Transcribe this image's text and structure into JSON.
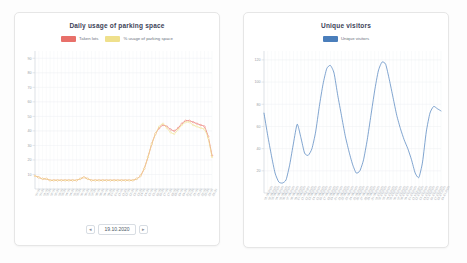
{
  "page": {
    "background": "#fdfdfd",
    "card_background": "#ffffff",
    "card_border": "#e6e6e6"
  },
  "cards": {
    "parking": {
      "title": "Daily usage of parking space",
      "pager": {
        "prev_label": "◂",
        "next_label": "▸",
        "date": "19.10.2020"
      }
    },
    "visitors": {
      "title": "Unique visitors"
    }
  },
  "chart_data": [
    {
      "type": "line",
      "name": "parking-usage-chart",
      "title": "Daily usage of parking space",
      "xlabel": "",
      "ylabel": "",
      "ylim": [
        0,
        95
      ],
      "yticks": [
        10,
        20,
        30,
        40,
        50,
        60,
        70,
        80,
        90
      ],
      "grid": true,
      "legend_position": "top-center",
      "categories": [
        "00:00",
        "00:30",
        "01:00",
        "01:30",
        "02:00",
        "02:30",
        "03:00",
        "03:30",
        "04:00",
        "04:30",
        "05:00",
        "05:30",
        "06:00",
        "06:30",
        "07:00",
        "07:30",
        "08:00",
        "08:30",
        "09:00",
        "09:30",
        "10:00",
        "10:30",
        "11:00",
        "11:30",
        "12:00",
        "12:30",
        "13:00",
        "13:30",
        "14:00",
        "14:30",
        "15:00",
        "15:30",
        "16:00",
        "16:30",
        "17:00",
        "17:30",
        "18:00",
        "18:30",
        "19:00",
        "19:30",
        "20:00",
        "20:30",
        "21:00",
        "21:30",
        "22:00",
        "22:30",
        "23:00",
        "23:30"
      ],
      "series": [
        {
          "name": "Taken lots",
          "color": "#e8706a",
          "values": [
            9,
            8,
            7,
            7,
            6,
            6,
            6,
            6,
            6,
            6,
            6,
            6,
            7,
            8,
            7,
            6,
            6,
            6,
            6,
            6,
            6,
            6,
            6,
            6,
            6,
            6,
            6,
            7,
            9,
            14,
            22,
            31,
            38,
            42,
            44,
            43,
            41,
            40,
            42,
            45,
            47,
            47,
            46,
            45,
            44,
            43,
            36,
            23
          ]
        },
        {
          "name": "% usage of parking space",
          "color": "#efe08c",
          "values": [
            9,
            8,
            7,
            7,
            6,
            6,
            6,
            6,
            6,
            6,
            6,
            6,
            7,
            8,
            7,
            6,
            6,
            6,
            6,
            6,
            6,
            6,
            6,
            6,
            6,
            6,
            6,
            7,
            9,
            14,
            22,
            31,
            38,
            43,
            45,
            42,
            39,
            38,
            41,
            44,
            46,
            46,
            44,
            43,
            42,
            41,
            35,
            22
          ]
        }
      ]
    },
    {
      "type": "line",
      "name": "unique-visitors-chart",
      "title": "Unique visitors",
      "xlabel": "",
      "ylabel": "",
      "ylim": [
        0,
        128
      ],
      "yticks": [
        20,
        40,
        60,
        80,
        100,
        120
      ],
      "grid": true,
      "legend_position": "top-center",
      "categories": [
        "01.09.2020",
        "02.09.2020",
        "03.09.2020",
        "04.09.2020",
        "05.09.2020",
        "06.09.2020",
        "07.09.2020",
        "08.09.2020",
        "09.09.2020",
        "10.09.2020",
        "11.09.2020",
        "12.09.2020",
        "13.09.2020",
        "14.09.2020",
        "15.09.2020",
        "16.09.2020",
        "17.09.2020",
        "18.09.2020",
        "19.09.2020",
        "20.09.2020",
        "21.09.2020",
        "22.09.2020",
        "23.09.2020",
        "24.09.2020",
        "25.09.2020",
        "26.09.2020",
        "27.09.2020",
        "28.09.2020",
        "29.09.2020",
        "30.09.2020",
        "01.10.2020",
        "02.10.2020",
        "03.10.2020",
        "04.10.2020",
        "05.10.2020",
        "06.10.2020",
        "07.10.2020",
        "08.10.2020",
        "09.10.2020",
        "10.10.2020",
        "11.10.2020",
        "12.10.2020",
        "13.10.2020",
        "14.10.2020",
        "15.10.2020",
        "16.10.2020",
        "17.10.2020",
        "18.10.2020",
        "19.10.2020"
      ],
      "series": [
        {
          "name": "Unique visitors",
          "color": "#4a7ebb",
          "values": [
            72,
            52,
            34,
            18,
            10,
            9,
            12,
            26,
            45,
            62,
            50,
            36,
            34,
            40,
            55,
            78,
            98,
            112,
            115,
            108,
            88,
            70,
            52,
            38,
            26,
            18,
            20,
            30,
            48,
            70,
            92,
            110,
            118,
            116,
            102,
            86,
            70,
            58,
            48,
            40,
            30,
            18,
            14,
            28,
            55,
            72,
            78,
            76,
            74
          ]
        }
      ]
    }
  ]
}
